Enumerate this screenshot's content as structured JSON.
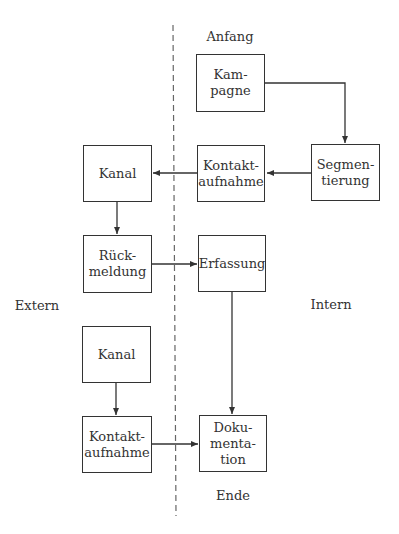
{
  "diagram": {
    "zones": {
      "left": "Extern",
      "right": "Intern"
    },
    "markers": {
      "start": "Anfang",
      "end": "Ende"
    },
    "nodes": [
      {
        "id": "kampagne",
        "lines": [
          "Kam-",
          "pagne"
        ],
        "zone": "Intern"
      },
      {
        "id": "segmentierung",
        "lines": [
          "Segmen-",
          "tierung"
        ],
        "zone": "Intern"
      },
      {
        "id": "kontaktaufnahme_intern",
        "lines": [
          "Kontakt-",
          "aufnahme"
        ],
        "zone": "Intern"
      },
      {
        "id": "kanal_1",
        "lines": [
          "Kanal"
        ],
        "zone": "Extern"
      },
      {
        "id": "rueckmeldung",
        "lines": [
          "Rück-",
          "meldung"
        ],
        "zone": "Extern"
      },
      {
        "id": "erfassung",
        "lines": [
          "Erfassung"
        ],
        "zone": "Intern"
      },
      {
        "id": "kanal_2",
        "lines": [
          "Kanal"
        ],
        "zone": "Extern"
      },
      {
        "id": "kontaktaufnahme_extern",
        "lines": [
          "Kontakt-",
          "aufnahme"
        ],
        "zone": "Extern"
      },
      {
        "id": "dokumentation",
        "lines": [
          "Doku-",
          "menta-",
          "tion"
        ],
        "zone": "Intern"
      }
    ],
    "edges": [
      {
        "from": "kampagne",
        "to": "segmentierung"
      },
      {
        "from": "segmentierung",
        "to": "kontaktaufnahme_intern"
      },
      {
        "from": "kontaktaufnahme_intern",
        "to": "kanal_1"
      },
      {
        "from": "kanal_1",
        "to": "rueckmeldung"
      },
      {
        "from": "rueckmeldung",
        "to": "erfassung"
      },
      {
        "from": "erfassung",
        "to": "dokumentation"
      },
      {
        "from": "kanal_2",
        "to": "kontaktaufnahme_extern"
      },
      {
        "from": "kontaktaufnahme_extern",
        "to": "dokumentation"
      }
    ],
    "colors": {
      "line": "#333333",
      "divider": "#666666",
      "background": "#ffffff"
    }
  }
}
